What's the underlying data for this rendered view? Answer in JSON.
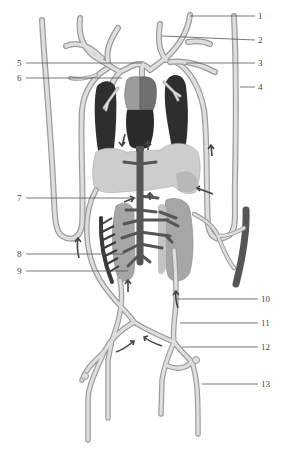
{
  "figure": {
    "type": "anatomical-diagram",
    "colors": {
      "background": "#ffffff",
      "vessel_fill": "#dedede",
      "vessel_outline": "#9a9a9a",
      "lung": "#2e2e2e",
      "atrium_left": "#9c9c9c",
      "atrium_right": "#707070",
      "ventricle": "#2a2a2a",
      "liver": "#cdcdcd",
      "kidney": "#a6a6a6",
      "vena_cava": "#555555",
      "arrow": "#444444",
      "label_text": "#444444"
    }
  },
  "labels": [
    {
      "id": "1",
      "text": "1",
      "side": "right",
      "x": 258,
      "y": 11
    },
    {
      "id": "2",
      "text": "2",
      "side": "right",
      "x": 258,
      "y": 35
    },
    {
      "id": "3",
      "text": "3",
      "side": "right",
      "x": 258,
      "y": 58
    },
    {
      "id": "4",
      "text": "4",
      "side": "right",
      "x": 258,
      "y": 82
    },
    {
      "id": "5",
      "text": "5",
      "side": "left",
      "x": 17,
      "y": 58
    },
    {
      "id": "6",
      "text": "6",
      "side": "left",
      "x": 17,
      "y": 73
    },
    {
      "id": "7",
      "text": "7",
      "side": "left",
      "x": 17,
      "y": 193
    },
    {
      "id": "8",
      "text": "8",
      "side": "left",
      "x": 17,
      "y": 249
    },
    {
      "id": "9",
      "text": "9",
      "side": "left",
      "x": 17,
      "y": 266
    },
    {
      "id": "10",
      "text": "10",
      "side": "right",
      "x": 261,
      "y": 294
    },
    {
      "id": "11",
      "text": "11",
      "side": "right",
      "x": 261,
      "y": 318
    },
    {
      "id": "12",
      "text": "12",
      "side": "right",
      "x": 261,
      "y": 342
    },
    {
      "id": "13",
      "text": "13",
      "side": "right",
      "x": 261,
      "y": 379
    }
  ]
}
